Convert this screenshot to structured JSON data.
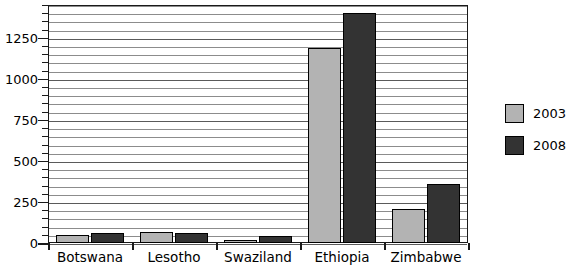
{
  "chart_data": {
    "type": "bar",
    "title": "",
    "xlabel": "",
    "ylabel": "",
    "categories": [
      "Botswana",
      "Lesotho",
      "Swaziland",
      "Ethiopia",
      "Zimbabwe"
    ],
    "series": [
      {
        "name": "2003",
        "color": "#b3b3b3",
        "values": [
          50,
          65,
          20,
          1190,
          205
        ]
      },
      {
        "name": "2008",
        "color": "#333333",
        "values": [
          60,
          60,
          40,
          1400,
          360
        ]
      }
    ],
    "ylim": [
      0,
      1450
    ],
    "ytick_labels": [
      "0",
      "250",
      "500",
      "750",
      "1000",
      "1250"
    ],
    "ytick_values": [
      0,
      250,
      500,
      750,
      1000,
      1250
    ],
    "yminor_step": 50,
    "grid": true,
    "legend_position": "right"
  },
  "legend": {
    "entries": [
      {
        "label": "2003",
        "color": "#b3b3b3"
      },
      {
        "label": "2008",
        "color": "#333333"
      }
    ]
  }
}
